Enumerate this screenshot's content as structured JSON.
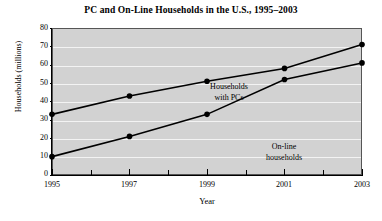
{
  "chart_data": {
    "type": "line",
    "title": "PC and On-Line Households in the U.S., 1995–2003",
    "xlabel": "Year",
    "ylabel": "Households (millions)",
    "x": [
      1995,
      1996,
      1997,
      1998,
      1999,
      2000,
      2001,
      2002,
      2003
    ],
    "xlim": [
      1995,
      2003
    ],
    "ylim": [
      0,
      80
    ],
    "xticks": [
      1995,
      1997,
      1999,
      2001,
      2003
    ],
    "xtick_labels": [
      "1995",
      "1997",
      "1999",
      "2001",
      "2003"
    ],
    "xticks_minor": [
      1996,
      1998,
      2000,
      2002
    ],
    "yticks": [
      0,
      10,
      20,
      30,
      40,
      50,
      60,
      70,
      80
    ],
    "ytick_labels": [
      "0",
      "10",
      "20",
      "30",
      "40",
      "50",
      "60",
      "70",
      "80"
    ],
    "grid": "horizontal-white",
    "legend": "inline-annotations",
    "marker": "filled-circle",
    "line_color": "#000000",
    "plot_background": "#d2d2d2",
    "gridline_color": "#f3f3f3",
    "series": [
      {
        "name": "Households with PCs",
        "annotation": [
          "Households",
          "with PCs"
        ],
        "x": [
          1995,
          1997,
          1999,
          2001,
          2003
        ],
        "values": [
          33,
          43,
          51,
          58,
          71
        ]
      },
      {
        "name": "On-line households",
        "annotation": [
          "On-line",
          "households"
        ],
        "x": [
          1995,
          1997,
          1999,
          2001,
          2003
        ],
        "values": [
          10,
          21,
          33,
          52,
          61
        ]
      }
    ]
  }
}
